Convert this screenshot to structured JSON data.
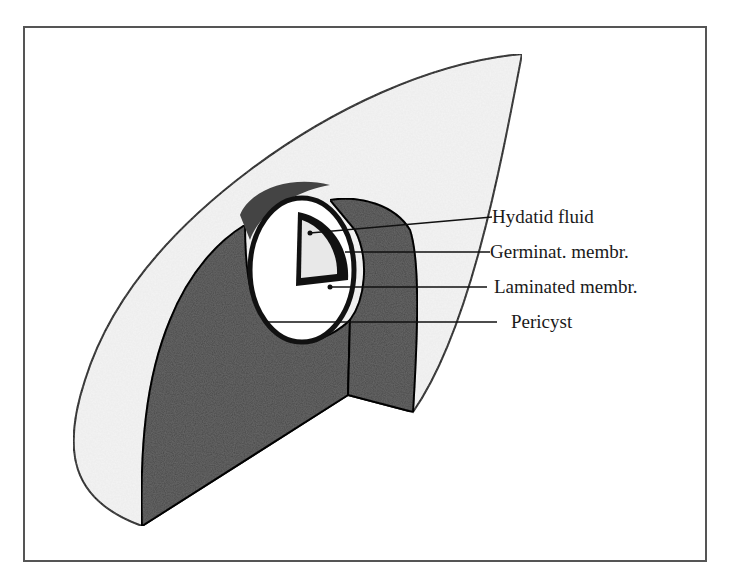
{
  "figure": {
    "labels": [
      {
        "id": "hydatid-fluid",
        "text": "Hydatid fluid"
      },
      {
        "id": "germinal-membrane",
        "text": "Germinat. membr."
      },
      {
        "id": "laminated-membrane",
        "text": "Laminated membr."
      },
      {
        "id": "pericyst",
        "text": "Pericyst"
      }
    ]
  },
  "colors": {
    "outline": "#111111",
    "tissue": "#6a6a6a",
    "surface": "#f4f4f4",
    "frame": "#555555"
  }
}
